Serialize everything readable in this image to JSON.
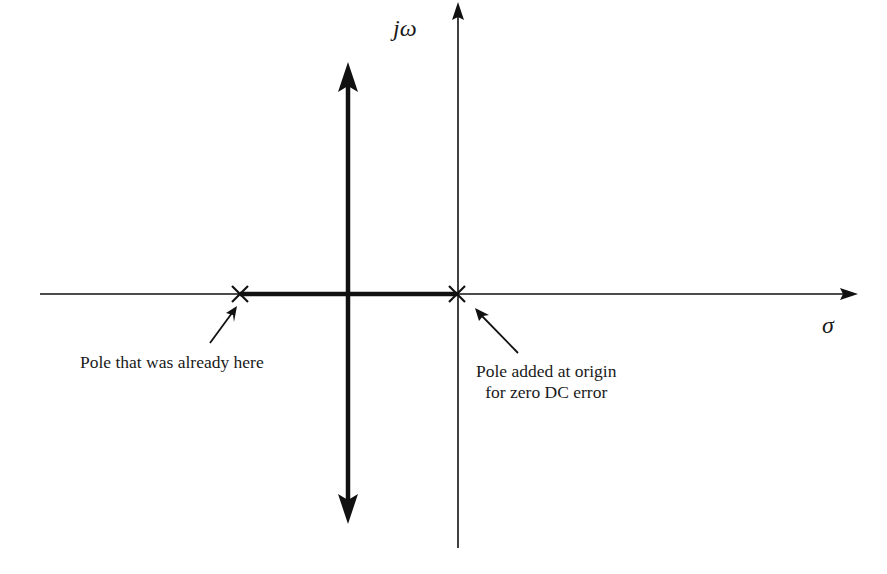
{
  "diagram": {
    "type": "root-locus",
    "axes": {
      "vertical_label": "jω",
      "horizontal_label": "σ"
    },
    "poles": [
      {
        "name": "existing-pole",
        "marker": "×"
      },
      {
        "name": "origin-pole",
        "marker": "×"
      }
    ],
    "annotations": {
      "existing_pole": "Pole that was already here",
      "origin_pole_line1": "Pole added at origin",
      "origin_pole_line2": "for zero DC error"
    },
    "colors": {
      "ink": "#111111",
      "background": "#ffffff"
    }
  }
}
